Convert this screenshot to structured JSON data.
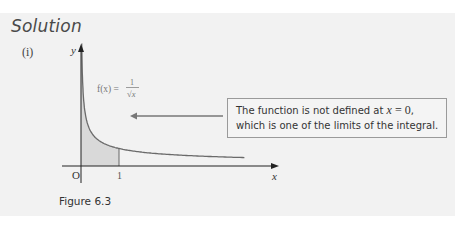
{
  "heading": "Solution",
  "part_label": "(i)",
  "figure_caption": "Figure 6.3",
  "callout": {
    "line1_prefix": "The function is not defined at ",
    "line1_var": "x",
    "line1_eq": " = ",
    "line1_val": "0",
    "line1_suffix": ",",
    "line2": "which is one of the limits of the integral."
  },
  "chart_data": {
    "type": "line",
    "title": "",
    "function_label": {
      "lhs": "f(x) = ",
      "numerator": "1",
      "denominator": "√x"
    },
    "xlabel": "x",
    "ylabel": "y",
    "origin_label": "O",
    "x_ticks": [
      {
        "value": 1,
        "label": "1"
      }
    ],
    "x_range": [
      -0.5,
      4.5
    ],
    "y_range": [
      0,
      3.2
    ],
    "shaded_region": {
      "from": 0,
      "to": 1,
      "description": "area under curve between x = 0 and x = 1"
    },
    "series": [
      {
        "name": "f(x) = 1/√x",
        "function": "1/sqrt(x)",
        "x_start": 0.012,
        "x_end": 4.3
      }
    ],
    "grid": false,
    "annotation": "The function is not defined at x = 0, which is one of the limits of the integral."
  },
  "colors": {
    "panel": "#f2f2f2",
    "curve": "#666666",
    "shade": "#d9d9d9",
    "axis": "#222222",
    "arrow": "#666666"
  }
}
